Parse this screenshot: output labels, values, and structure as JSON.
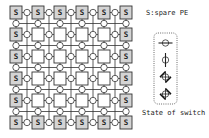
{
  "diagram": {
    "grid": {
      "rows": 6,
      "cols": 6,
      "col_left": [
        10,
        32,
        54,
        76,
        98,
        120
      ],
      "row_top": [
        6,
        28,
        50,
        72,
        94,
        116
      ],
      "box_w": 12,
      "box_h": 13,
      "switch_r": 3.2,
      "spare_label": "S",
      "spare_rule": "border",
      "colors": {
        "line": "#333333",
        "spare_fill": "#d4d4d4",
        "pe_fill": "#ffffff",
        "box_stroke": "#333333",
        "switch_fill": "#ffffff"
      }
    },
    "legend": {
      "spare_text": "S:spare PE",
      "state_text": "State of switch",
      "box": {
        "x": 154,
        "y": 33,
        "w": 23,
        "h": 71
      },
      "switch_states": [
        {
          "name": "horizontal-pass",
          "cx": 165.5,
          "cy": 43
        },
        {
          "name": "vertical-pass",
          "cx": 165.5,
          "cy": 60
        },
        {
          "name": "diagonal-turn-a",
          "cx": 165.5,
          "cy": 77
        },
        {
          "name": "diagonal-turn-b",
          "cx": 165.5,
          "cy": 94
        }
      ]
    }
  }
}
